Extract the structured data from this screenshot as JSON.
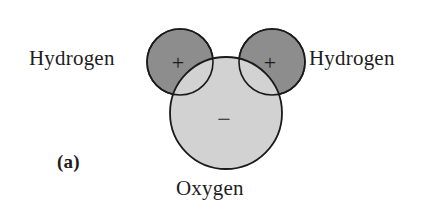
{
  "figure": {
    "label": "(a)",
    "background_color": "#ffffff",
    "outline_color": "#1a1a1a"
  },
  "diagram": {
    "type": "water-molecule-polarity",
    "atoms": [
      {
        "id": "hydrogen-left",
        "label": "Hydrogen",
        "charge": "+",
        "fill_color": "#8d8d8d",
        "center_x": 180,
        "center_y": 62,
        "radius": 33
      },
      {
        "id": "hydrogen-right",
        "label": "Hydrogen",
        "charge": "+",
        "fill_color": "#8d8d8d",
        "center_x": 272,
        "center_y": 62,
        "radius": 33
      },
      {
        "id": "oxygen",
        "label": "Oxygen",
        "charge": "−",
        "fill_color": "#d2d2d2",
        "center_x": 226,
        "center_y": 113,
        "radius": 56
      }
    ]
  },
  "labels": {
    "hydrogen_left": "Hydrogen",
    "hydrogen_right": "Hydrogen",
    "oxygen": "Oxygen"
  },
  "charges": {
    "hydrogen_left": "+",
    "hydrogen_right": "+",
    "oxygen": "−"
  }
}
